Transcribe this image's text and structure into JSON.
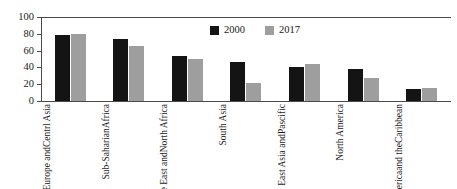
{
  "chart_data": {
    "type": "bar",
    "title": "",
    "subtitle": "",
    "xlabel": "",
    "ylabel": "",
    "ylim": [
      0,
      100
    ],
    "ytick_labels": [
      "100",
      "80",
      "60",
      "40",
      "20",
      "0"
    ],
    "ytick_values": [
      100,
      80,
      60,
      40,
      20,
      0
    ],
    "grid": false,
    "legend_position": "inside-upper-center-right",
    "categories": [
      "Europe and Centrl Asia",
      "Sub-Saharian Africa",
      "Middle East and North Africa",
      "South Asia",
      "East Asia and Pascific",
      "North America",
      "Latin America and the Caribbean"
    ],
    "category_label_lines": [
      [
        "Europe and",
        "Centrl Asia"
      ],
      [
        "Sub-Saharian",
        "Africa"
      ],
      [
        "Middle East and",
        "North Africa"
      ],
      [
        "South Asia"
      ],
      [
        "East Asia and",
        "Pascific"
      ],
      [
        "North America"
      ],
      [
        "Latin America",
        "and the",
        "Caribbean"
      ]
    ],
    "series": [
      {
        "name": "2000",
        "color": "#141414",
        "values": [
          79,
          74,
          53,
          46,
          41,
          38,
          14
        ]
      },
      {
        "name": "2017",
        "color": "#9e9e9e",
        "values": [
          80,
          65,
          50,
          22,
          44,
          27,
          16
        ]
      }
    ]
  },
  "legend": {
    "entries": [
      {
        "label": "2000",
        "color": "#141414"
      },
      {
        "label": "2017",
        "color": "#9e9e9e"
      }
    ]
  },
  "colors": {
    "series_2000": "#141414",
    "series_2017": "#9e9e9e",
    "axis": "#4a4a4a",
    "text": "#1a1a1a",
    "background": "#ffffff"
  }
}
